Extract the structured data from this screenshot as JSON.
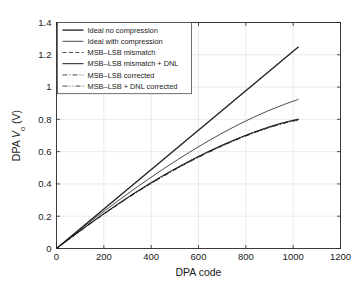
{
  "chart_data": {
    "type": "line",
    "title": "",
    "xlabel": "DPA code",
    "ylabel": "DPA Vo (V)",
    "ylabel_parts": {
      "prefix": "DPA ",
      "symbol": "V",
      "subscript": "o",
      "suffix": " (V)"
    },
    "xlim": [
      0,
      1200
    ],
    "ylim": [
      0,
      1.4
    ],
    "xticks": [
      0,
      200,
      400,
      600,
      800,
      1000,
      1200
    ],
    "xtick_labels": [
      "0",
      "200",
      "400",
      "600",
      "800",
      "1000",
      "1200"
    ],
    "yticks": [
      0,
      0.2,
      0.4,
      0.6,
      0.8,
      1,
      1.2,
      1.4
    ],
    "ytick_labels": [
      "0",
      "0.2",
      "0.4",
      "0.6",
      "0.8",
      "1",
      "1.2",
      "1.4"
    ],
    "grid": true,
    "grid_color": "#d8d8d8",
    "legend_position": "top-left",
    "series": [
      {
        "name": "Ideal no compression",
        "style": "solid",
        "width": 1.3,
        "color": "#1c1c1c",
        "x": [
          0,
          1023
        ],
        "y": [
          0,
          1.25
        ]
      },
      {
        "name": "Ideal with compression",
        "style": "solid",
        "width": 0.8,
        "color": "#1c1c1c",
        "x": [
          0,
          64,
          128,
          192,
          256,
          320,
          384,
          448,
          512,
          576,
          640,
          704,
          768,
          832,
          896,
          960,
          1023
        ],
        "y": [
          0,
          0.0755,
          0.1493,
          0.2212,
          0.2913,
          0.3594,
          0.4254,
          0.4892,
          0.5505,
          0.6092,
          0.665,
          0.7177,
          0.767,
          0.8126,
          0.8542,
          0.8914,
          0.924
        ]
      },
      {
        "name": "MSB–LSB mismatch",
        "style": "dashed",
        "width": 0.8,
        "color": "#1c1c1c",
        "x": [
          0,
          64,
          128,
          192,
          256,
          320,
          384,
          448,
          512,
          576,
          640,
          704,
          768,
          832,
          896,
          960,
          1023
        ],
        "y": [
          0,
          0.07,
          0.139,
          0.206,
          0.2705,
          0.3325,
          0.3915,
          0.4475,
          0.5005,
          0.5505,
          0.5975,
          0.641,
          0.6815,
          0.718,
          0.7505,
          0.778,
          0.8
        ]
      },
      {
        "name": "MSB–LSB mismatch + DNL",
        "style": "solid",
        "width": 1.0,
        "color": "#1c1c1c",
        "x": [
          0,
          64,
          128,
          192,
          256,
          320,
          384,
          448,
          512,
          576,
          640,
          704,
          768,
          832,
          896,
          960,
          1023
        ],
        "y": [
          0,
          0.0708,
          0.1405,
          0.208,
          0.273,
          0.3352,
          0.3945,
          0.4505,
          0.5035,
          0.5532,
          0.5998,
          0.6432,
          0.6832,
          0.7196,
          0.7522,
          0.7802,
          0.802
        ]
      },
      {
        "name": "MSB–LSB corrected",
        "style": "dashdot",
        "width": 0.8,
        "color": "#1c1c1c",
        "x": [
          0,
          64,
          128,
          192,
          256,
          320,
          384,
          448,
          512,
          576,
          640,
          704,
          768,
          832,
          896,
          960,
          1023
        ],
        "y": [
          0,
          0.069,
          0.1372,
          0.2038,
          0.268,
          0.3296,
          0.3882,
          0.444,
          0.4968,
          0.5466,
          0.5934,
          0.637,
          0.6775,
          0.7145,
          0.7472,
          0.7752,
          0.796
        ]
      },
      {
        "name": "MSB–LSB + DNL corrected",
        "style": "dashdotdot",
        "width": 0.8,
        "color": "#1c1c1c",
        "x": [
          0,
          64,
          128,
          192,
          256,
          320,
          384,
          448,
          512,
          576,
          640,
          704,
          768,
          832,
          896,
          960,
          1023
        ],
        "y": [
          0,
          0.0696,
          0.1382,
          0.205,
          0.2694,
          0.3312,
          0.39,
          0.4458,
          0.4988,
          0.5486,
          0.5954,
          0.639,
          0.6795,
          0.7163,
          0.749,
          0.7768,
          0.798
        ]
      }
    ]
  }
}
